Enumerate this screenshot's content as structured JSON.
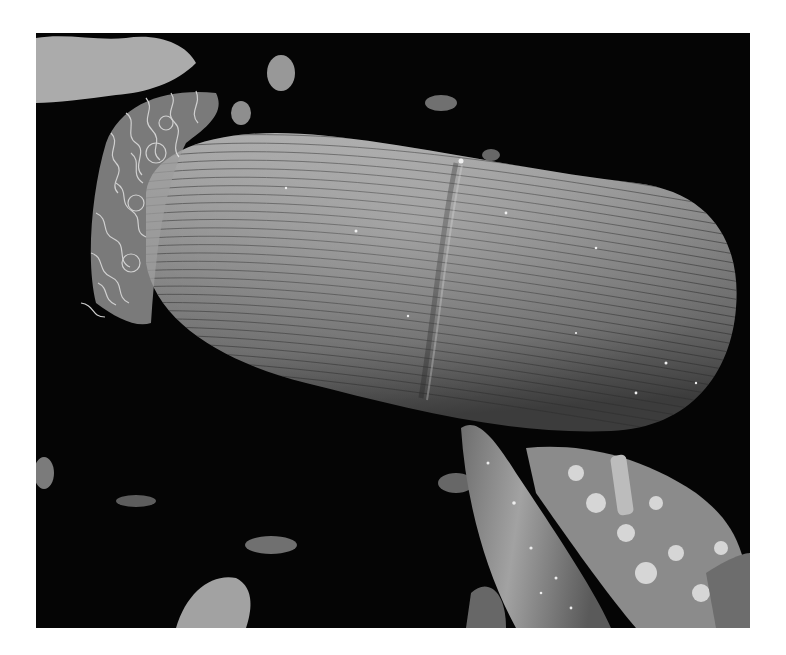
{
  "image": {
    "kind": "scanning electron micrograph",
    "palette": {
      "background": "#ffffff",
      "frame": "#050505",
      "body_light": "#b8b8b8",
      "body_mid": "#7d7d7d",
      "body_dark": "#3a3a3a",
      "cilia": "#e6e6e6",
      "debris": "#cfcfcf"
    },
    "subjects": [
      {
        "name": "ciliate-body",
        "description": "elongated barrel-shaped cell with fine longitudinal striations and a shallow transverse groove"
      },
      {
        "name": "cilia-tuft",
        "description": "dense tuft of curled cilia at the left (anterior) end"
      },
      {
        "name": "spine",
        "description": "smooth conical spine entering from the lower right"
      },
      {
        "name": "debris",
        "description": "fluffy particulate clumps scattered across the dark substrate"
      }
    ]
  }
}
